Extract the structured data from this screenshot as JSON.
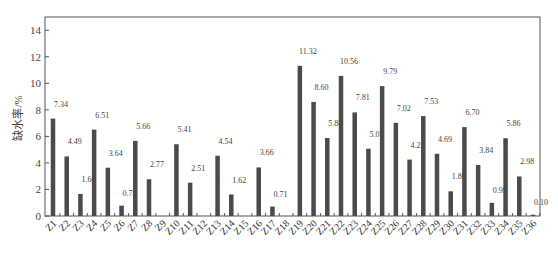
{
  "chart_data": {
    "type": "bar",
    "title": "",
    "xlabel": "",
    "ylabel": "缺水率/%",
    "ylim": [
      0,
      15
    ],
    "yticks": [
      0,
      2,
      4,
      6,
      8,
      10,
      12,
      14
    ],
    "grid": false,
    "legend": null,
    "bar_color": "#4a4a4a",
    "categories": [
      "Z1",
      "Z2",
      "Z3",
      "Z4",
      "Z5",
      "Z6",
      "Z7",
      "Z8",
      "Z9",
      "Z10",
      "Z11",
      "Z12",
      "Z13",
      "Z14",
      "Z15",
      "Z16",
      "Z17",
      "Z18",
      "Z19",
      "Z20",
      "Z21",
      "Z22",
      "Z23",
      "Z24",
      "Z25",
      "Z26",
      "Z27",
      "Z28",
      "Z29",
      "Z30",
      "Z31",
      "Z32",
      "Z33",
      "Z34",
      "Z35",
      "Z36"
    ],
    "values": [
      7.34,
      4.49,
      1.66,
      6.51,
      3.64,
      0.78,
      5.66,
      2.77,
      0,
      5.41,
      2.51,
      0,
      4.54,
      1.62,
      0,
      3.66,
      0.71,
      0,
      11.32,
      8.6,
      5.88,
      10.56,
      7.81,
      5.07,
      9.79,
      7.02,
      4.25,
      7.53,
      4.69,
      1.86,
      6.7,
      3.84,
      0.99,
      5.86,
      2.98,
      0.1
    ],
    "value_labels": [
      "7.34",
      "4.49",
      "1.66",
      "6.51",
      "3.64",
      "0.78",
      "5.66",
      "2.77",
      "",
      "5.41",
      "2.51",
      "",
      "4.54",
      "1.62",
      "",
      "3.66",
      "0.71",
      "",
      "11.32",
      "8.60",
      "5.88",
      "10.56",
      "7.81",
      "5.07",
      "9.79",
      "7.02",
      "4.25",
      "7.53",
      "4.69",
      "1.86",
      "6.70",
      "3.84",
      "0.99",
      "5.86",
      "2.98",
      "0.10"
    ]
  }
}
